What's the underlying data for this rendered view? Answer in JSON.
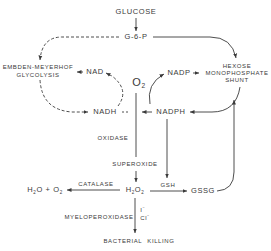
{
  "diagram": {
    "nodes": {
      "glucose": "GLUCOSE",
      "g6p": "G-6-P",
      "glycolysis_line1": "EMBDEN-MEYERHOF",
      "glycolysis_line2": "GLYCOLYSIS",
      "hmp_line1": "HEXOSE",
      "hmp_line2": "MONOPHOSPHATE",
      "hmp_line3": "SHUNT",
      "nad": "NAD",
      "nadp": "NADP",
      "o2_base": "O",
      "o2_sub": "2",
      "nadh": "NADH",
      "nadph": "NADPH",
      "oxidase": "OXIDASE",
      "superoxide": "SUPEROXIDE",
      "h2o2": {
        "h": "H",
        "s1": "2",
        "o": "O",
        "s2": "2"
      },
      "catalase": "CATALASE",
      "water_oxygen": {
        "h": "H",
        "s1": "2",
        "o": "O + O",
        "s2": "2"
      },
      "gsh": "GSH",
      "gssg": "GSSG",
      "myeloperoxidase": "MYELOPEROXIDASE",
      "iodide": {
        "base": "I",
        "sup": "−"
      },
      "chloride": {
        "base": "Cl",
        "sup": "−"
      },
      "bacterial_killing": "BACTERIAL KILLING"
    },
    "colors": {
      "ink": "#3a3a3a",
      "background": "#ffffff"
    }
  }
}
